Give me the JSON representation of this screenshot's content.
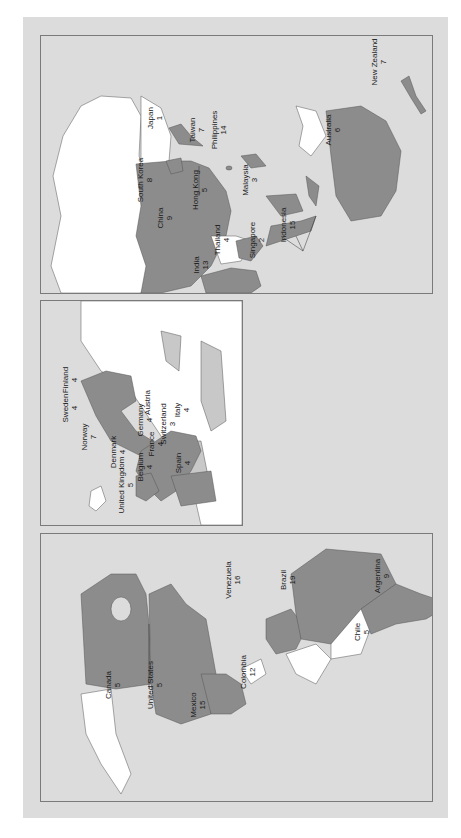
{
  "colors": {
    "background": "#dcdcdc",
    "highlighted_country": "#8c8c8c",
    "other_land": "#ffffff",
    "light_land": "#c8c8c8",
    "border": "#7a7a7a",
    "text": "#1a1a1a"
  },
  "orientation": "rotated 90 degrees counter-clockwise",
  "panels": {
    "asia_pacific": {
      "labels": [
        {
          "country": "Japan",
          "value": "1",
          "x": 155,
          "y": 118
        },
        {
          "country": "Taiwan",
          "value": "7",
          "x": 197,
          "y": 130
        },
        {
          "country": "Philippines",
          "value": "14",
          "x": 219,
          "y": 130
        },
        {
          "country": "South Korea",
          "value": "8",
          "x": 145,
          "y": 180
        },
        {
          "country": "China",
          "value": "9",
          "x": 165,
          "y": 218
        },
        {
          "country": "Hong Kong",
          "value": "5",
          "x": 200,
          "y": 190
        },
        {
          "country": "Malaysia",
          "value": "3",
          "x": 250,
          "y": 180
        },
        {
          "country": "Thailand",
          "value": "4",
          "x": 222,
          "y": 240
        },
        {
          "country": "Singapore",
          "value": "2",
          "x": 257,
          "y": 240
        },
        {
          "country": "Indonesia",
          "value": "15",
          "x": 288,
          "y": 225
        },
        {
          "country": "India",
          "value": "13",
          "x": 200,
          "y": 265
        },
        {
          "country": "Australia",
          "value": "6",
          "x": 332,
          "y": 130
        },
        {
          "country": "New Zealand",
          "value": "7",
          "x": 378,
          "y": 62
        }
      ]
    },
    "europe": {
      "labels": [
        {
          "country": "Finland",
          "value": "4",
          "x": 70,
          "y": 380
        },
        {
          "country": "Sweden",
          "value": "4",
          "x": 70,
          "y": 408
        },
        {
          "country": "Norway",
          "value": "7",
          "x": 88,
          "y": 437
        },
        {
          "country": "Denmark",
          "value": "4",
          "x": 118,
          "y": 452
        },
        {
          "country": "United Kingdom",
          "value": "5",
          "x": 126,
          "y": 485
        },
        {
          "country": "Belgium",
          "value": "4",
          "x": 145,
          "y": 467
        },
        {
          "country": "Germany",
          "value": "4",
          "x": 145,
          "y": 420
        },
        {
          "country": "Austria",
          "value": "",
          "x": 147,
          "y": 402
        },
        {
          "country": "France",
          "value": "4",
          "x": 156,
          "y": 444
        },
        {
          "country": "Switzerland",
          "value": "3",
          "x": 167,
          "y": 424
        },
        {
          "country": "Italy",
          "value": "4",
          "x": 182,
          "y": 410
        },
        {
          "country": "Spain",
          "value": "4",
          "x": 183,
          "y": 463
        }
      ]
    },
    "americas": {
      "labels": [
        {
          "country": "Canada",
          "value": "5",
          "x": 113,
          "y": 685
        },
        {
          "country": "United States",
          "value": "5",
          "x": 155,
          "y": 685
        },
        {
          "country": "Mexico",
          "value": "15",
          "x": 197,
          "y": 705
        },
        {
          "country": "Venezuela",
          "value": "16",
          "x": 232,
          "y": 580
        },
        {
          "country": "Colombia",
          "value": "12",
          "x": 248,
          "y": 672
        },
        {
          "country": "Brazil",
          "value": "19",
          "x": 288,
          "y": 580
        },
        {
          "country": "Chile",
          "value": "5",
          "x": 362,
          "y": 632
        },
        {
          "country": "Argentina",
          "value": "9",
          "x": 382,
          "y": 576
        }
      ]
    }
  }
}
